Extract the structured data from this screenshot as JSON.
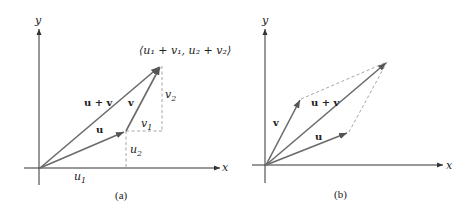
{
  "panel_a": {
    "caption": "(a)",
    "axis_x_label": "x",
    "axis_y_label": "y",
    "labels": {
      "u": "u",
      "v": "v",
      "u_plus_v": "u + v",
      "u1": "u",
      "u1_sub": "1",
      "u2": "u",
      "u2_sub": "2",
      "v1": "v",
      "v1_sub": "1",
      "v2": "v",
      "v2_sub": "2",
      "sum_point": "⟨u₁ + v₁, u₂ + v₂⟩"
    }
  },
  "panel_b": {
    "caption": "(b)",
    "axis_x_label": "x",
    "axis_y_label": "y",
    "labels": {
      "u": "u",
      "v": "v",
      "u_plus_v": "u + v"
    }
  },
  "colors": {
    "vector": "#6b6b6b",
    "axis": "#333333",
    "dashed": "#9a9a9a"
  }
}
